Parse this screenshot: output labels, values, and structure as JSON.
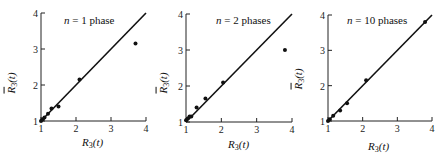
{
  "chart_data": [
    {
      "type": "scatter",
      "title": "",
      "annotation": "n = 1 phase",
      "xlabel": "R3(t)",
      "ylabel": "R̄3(t)",
      "xlim": [
        1,
        4
      ],
      "ylim": [
        1,
        4
      ],
      "xticks": [
        "1",
        "2",
        "3",
        "4"
      ],
      "yticks": [
        "1",
        "2",
        "3",
        "4"
      ],
      "grid": false,
      "reference_line": "y = x",
      "points": [
        [
          1.0,
          1.0
        ],
        [
          1.05,
          1.05
        ],
        [
          1.1,
          1.1
        ],
        [
          1.2,
          1.2
        ],
        [
          1.3,
          1.35
        ],
        [
          1.5,
          1.4
        ],
        [
          2.1,
          2.15
        ],
        [
          3.7,
          3.15
        ]
      ]
    },
    {
      "type": "scatter",
      "title": "",
      "annotation": "n = 2 phases",
      "xlabel": "R3(t)",
      "ylabel": "R̄3(t)",
      "xlim": [
        1,
        4
      ],
      "ylim": [
        1,
        4
      ],
      "xticks": [
        "1",
        "2",
        "3",
        "4"
      ],
      "yticks": [
        "1",
        "2",
        "3",
        "4"
      ],
      "grid": false,
      "reference_line": "y = x",
      "points": [
        [
          1.0,
          1.05
        ],
        [
          1.05,
          1.1
        ],
        [
          1.1,
          1.15
        ],
        [
          1.15,
          1.15
        ],
        [
          1.3,
          1.4
        ],
        [
          1.55,
          1.65
        ],
        [
          2.05,
          2.1
        ],
        [
          3.8,
          3.0
        ]
      ]
    },
    {
      "type": "scatter",
      "title": "",
      "annotation": "n = 10 phases",
      "xlabel": "R3(t)",
      "ylabel": "R̄3(t)",
      "xlim": [
        1,
        4
      ],
      "ylim": [
        1,
        4
      ],
      "xticks": [
        "1",
        "2",
        "3",
        "4"
      ],
      "yticks": [
        "1",
        "2",
        "3",
        "4"
      ],
      "grid": false,
      "reference_line": "y = x",
      "points": [
        [
          1.0,
          1.0
        ],
        [
          1.05,
          1.05
        ],
        [
          1.15,
          1.15
        ],
        [
          1.35,
          1.3
        ],
        [
          1.55,
          1.5
        ],
        [
          2.1,
          2.15
        ],
        [
          3.8,
          3.8
        ]
      ]
    }
  ],
  "panels": [
    {
      "annotation_var": "n",
      "annotation_rest": " = 1 phase"
    },
    {
      "annotation_var": "n",
      "annotation_rest": " = 2 phases"
    },
    {
      "annotation_var": "n",
      "annotation_rest": " = 10 phases"
    }
  ],
  "axis": {
    "xlabel_main": "R",
    "xlabel_sub": "3",
    "xlabel_arg": "(t)",
    "ylabel_main": "R",
    "ylabel_sub": "3",
    "ylabel_arg": "(t)",
    "ticks": [
      "1",
      "2",
      "3",
      "4"
    ]
  }
}
